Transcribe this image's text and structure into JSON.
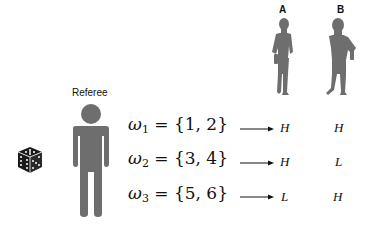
{
  "figure": {
    "referee": {
      "label": "Referee",
      "icon": "person-icon"
    },
    "players": [
      {
        "label": "A",
        "icon": "worker-woman-silhouette-icon"
      },
      {
        "label": "B",
        "icon": "worker-man-silhouette-icon"
      }
    ],
    "dice": {
      "icon": "dice-icon"
    },
    "rows": [
      {
        "omega": "ω",
        "sub": "1",
        "set": "= {1, 2}",
        "A": "H",
        "B": "H"
      },
      {
        "omega": "ω",
        "sub": "2",
        "set": "= {3, 4}",
        "A": "H",
        "B": "L"
      },
      {
        "omega": "ω",
        "sub": "3",
        "set": "= {5, 6}",
        "A": "L",
        "B": "H"
      }
    ],
    "colors": {
      "silhouette": "#6e6e6e",
      "dice": "#1a1a1a",
      "text": "#111111"
    }
  }
}
